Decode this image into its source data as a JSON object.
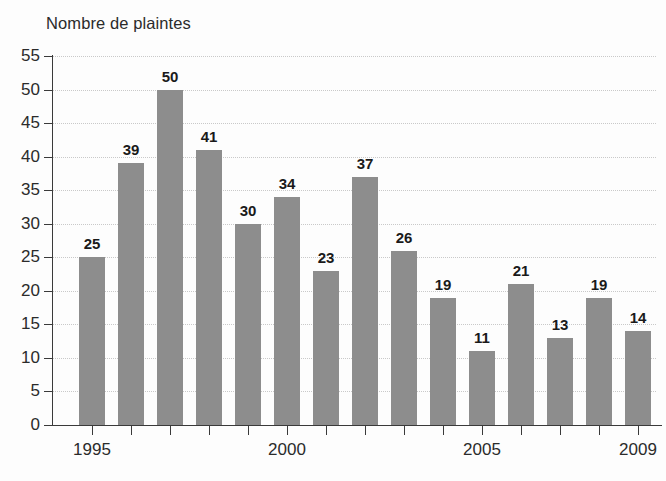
{
  "chart_data": {
    "type": "bar",
    "title": "Nombre de plaintes",
    "xlabel": "",
    "ylabel": "",
    "ylim": [
      0,
      55
    ],
    "ytick_step": 5,
    "yticks": [
      0,
      5,
      10,
      15,
      20,
      25,
      30,
      35,
      40,
      45,
      50,
      55
    ],
    "grid": true,
    "grid_axis": "y",
    "legend": false,
    "categories": [
      1995,
      1996,
      1997,
      1998,
      1999,
      2000,
      2001,
      2002,
      2003,
      2004,
      2005,
      2006,
      2007,
      2008,
      2009
    ],
    "xtick_labels_shown": [
      "1995",
      "2000",
      "2005",
      "2009"
    ],
    "xtick_labels_shown_at": [
      1995,
      2000,
      2005,
      2009
    ],
    "values": [
      25,
      39,
      50,
      41,
      30,
      34,
      23,
      37,
      26,
      19,
      11,
      21,
      13,
      19,
      14
    ],
    "data_labels": [
      "25",
      "39",
      "50",
      "41",
      "30",
      "34",
      "23",
      "37",
      "26",
      "19",
      "11",
      "21",
      "13",
      "19",
      "14"
    ],
    "bar_color": "#8d8d8d",
    "axis_color": "#3a3a3a",
    "grid_color": "#c9c9c9",
    "label_color": "#1a1a1a",
    "background": "#ffffff"
  }
}
